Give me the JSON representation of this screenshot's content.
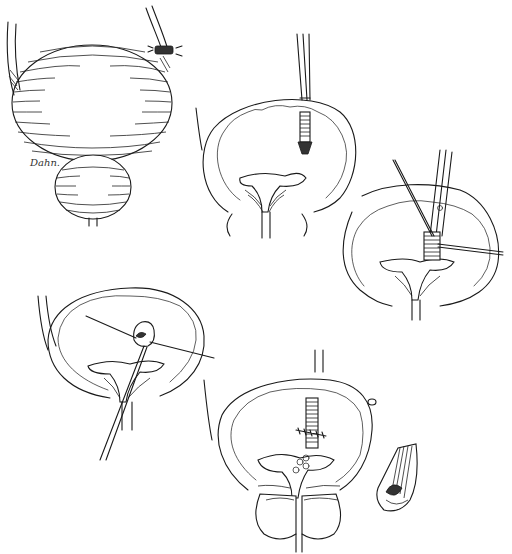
{
  "figure": {
    "type": "surgical-illustration",
    "style": "black-and-white line drawing",
    "signature": "Dahn.",
    "colors": {
      "ink": "#1a1a1a",
      "background": "#ffffff"
    },
    "panels": [
      {
        "id": "A",
        "subject": "Distended bladder with ligated ureter/urachus (external view)"
      },
      {
        "id": "B",
        "subject": "Bladder opened; clamp holding tubular structure above trigone"
      },
      {
        "id": "C",
        "subject": "Clamp with traction sutures at ureteral orifice region"
      },
      {
        "id": "D",
        "subject": "Everted tissue with sutures passed through bladder neck"
      },
      {
        "id": "E",
        "subject": "Closure with sutures; prostate below bladder"
      },
      {
        "id": "F",
        "subject": "Inset: detail of everted stump"
      }
    ]
  }
}
